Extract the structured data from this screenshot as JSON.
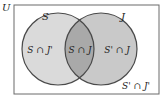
{
  "diagram": {
    "type": "venn",
    "universe": {
      "label": "U"
    },
    "sets": [
      {
        "id": "S",
        "label": "S",
        "fill": "#dadada"
      },
      {
        "id": "J",
        "label": "J",
        "fill": "#c9c9c9"
      }
    ],
    "regions": [
      {
        "id": "s-only",
        "label": "S ∩ J'"
      },
      {
        "id": "intersection",
        "label": "S ∩ J",
        "fill": "#a9a9a9"
      },
      {
        "id": "j-only",
        "label": "S' ∩ J"
      },
      {
        "id": "neither",
        "label": "S' ∩ J'"
      }
    ],
    "colors": {
      "stroke": "#4a4a4a",
      "background": "#ffffff",
      "text": "#222222"
    }
  }
}
